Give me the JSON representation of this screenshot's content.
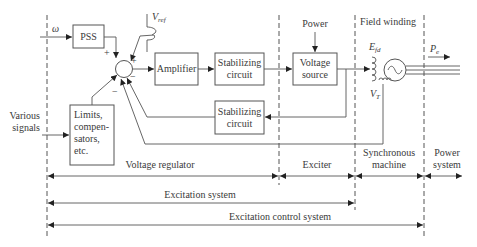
{
  "diagram": {
    "inputs": {
      "omega": "ω",
      "vref": "V",
      "vref_sub": "ref",
      "various_signals_line1": "Various",
      "various_signals_line2": "signals",
      "power": "Power"
    },
    "blocks": {
      "pss": "PSS",
      "amplifier": "Amplifier",
      "stab_top_line1": "Stabilizing",
      "stab_top_line2": "circuit",
      "voltage_source_line1": "Voltage",
      "voltage_source_line2": "source",
      "stab_bottom_line1": "Stabilizing",
      "stab_bottom_line2": "circuit",
      "limits_line1": "Limits,",
      "limits_line2": "compen-",
      "limits_line3": "sators,",
      "limits_line4": "etc."
    },
    "signs": {
      "pss_plus": "+",
      "vref_plus": "+",
      "feedback_minus_right": "−",
      "feedback_minus_left": "−"
    },
    "machine": {
      "field_winding": "Field winding",
      "efd": "E",
      "efd_sub": "fd",
      "pe": "P",
      "pe_sub": "e",
      "vt": "V",
      "vt_sub": "T"
    },
    "regions": {
      "voltage_regulator": "Voltage regulator",
      "exciter": "Exciter",
      "sync_machine_line1": "Synchronous",
      "sync_machine_line2": "machine",
      "power_system_line1": "Power",
      "power_system_line2": "system",
      "excitation_system": "Excitation system",
      "excitation_control_system": "Excitation control system"
    },
    "colors": {
      "line": "#555555",
      "text": "#3a3a3a",
      "arrow": "#222222",
      "background": "#ffffff"
    }
  }
}
